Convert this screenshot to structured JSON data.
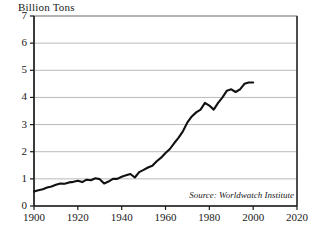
{
  "chart_data": {
    "type": "line",
    "title": "Billion Tons",
    "xlabel": "",
    "ylabel": "Billion Tons",
    "xlim": [
      1900,
      2020
    ],
    "ylim": [
      0,
      7
    ],
    "grid": true,
    "legend": null,
    "annotations": [
      {
        "name": "source",
        "text": "Source: Worldwatch Institute"
      }
    ],
    "yticks": [
      0,
      1,
      2,
      3,
      4,
      5,
      6,
      7
    ],
    "ytick_labels": [
      "0",
      "1",
      "2",
      "3",
      "4",
      "5",
      "6",
      "7"
    ],
    "xticks": [
      1900,
      1920,
      1940,
      1960,
      1980,
      2000,
      2020
    ],
    "xtick_labels": [
      "1900",
      "1920",
      "1940",
      "1960",
      "1980",
      "2000",
      "2020"
    ],
    "series": [
      {
        "name": "Carbon Emissions",
        "color": "#111111",
        "x": [
          1900,
          1902,
          1904,
          1906,
          1908,
          1910,
          1912,
          1914,
          1916,
          1918,
          1920,
          1922,
          1924,
          1926,
          1928,
          1930,
          1932,
          1934,
          1936,
          1938,
          1940,
          1942,
          1944,
          1946,
          1948,
          1950,
          1952,
          1954,
          1956,
          1958,
          1960,
          1962,
          1964,
          1966,
          1968,
          1970,
          1972,
          1974,
          1976,
          1978,
          1980,
          1982,
          1984,
          1986,
          1988,
          1990,
          1992,
          1994,
          1996,
          1998,
          2000
        ],
        "values": [
          0.53,
          0.58,
          0.62,
          0.68,
          0.72,
          0.78,
          0.83,
          0.82,
          0.87,
          0.89,
          0.93,
          0.88,
          0.97,
          0.95,
          1.02,
          0.99,
          0.83,
          0.9,
          1.0,
          1.0,
          1.08,
          1.13,
          1.18,
          1.05,
          1.25,
          1.33,
          1.42,
          1.48,
          1.65,
          1.78,
          1.95,
          2.1,
          2.32,
          2.52,
          2.76,
          3.08,
          3.3,
          3.45,
          3.55,
          3.8,
          3.7,
          3.55,
          3.8,
          4.0,
          4.25,
          4.3,
          4.2,
          4.3,
          4.5,
          4.55,
          4.55
        ]
      }
    ]
  },
  "axes": {
    "plot_left_px": 34,
    "plot_right_px": 297,
    "plot_top_px": 16,
    "plot_bottom_px": 206
  }
}
